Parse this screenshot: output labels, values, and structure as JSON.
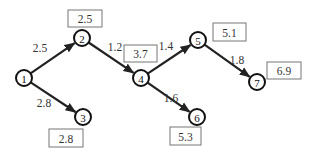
{
  "diagram": {
    "type": "directed-network",
    "nodes": [
      {
        "id": "1",
        "label": "1",
        "value": null
      },
      {
        "id": "2",
        "label": "2",
        "value": "2.5"
      },
      {
        "id": "3",
        "label": "3",
        "value": "2.8"
      },
      {
        "id": "4",
        "label": "4",
        "value": "3.7"
      },
      {
        "id": "5",
        "label": "5",
        "value": "5.1"
      },
      {
        "id": "6",
        "label": "6",
        "value": "5.3"
      },
      {
        "id": "7",
        "label": "7",
        "value": "6.9"
      }
    ],
    "edges": [
      {
        "from": "1",
        "to": "2",
        "weight": "2.5"
      },
      {
        "from": "1",
        "to": "3",
        "weight": "2.8"
      },
      {
        "from": "2",
        "to": "4",
        "weight": "1.2"
      },
      {
        "from": "4",
        "to": "5",
        "weight": "1.4"
      },
      {
        "from": "4",
        "to": "6",
        "weight": "1.6"
      },
      {
        "from": "5",
        "to": "7",
        "weight": "1.8"
      }
    ],
    "colors": {
      "line": "#222222",
      "box_border": "#777777",
      "text": "#333333"
    }
  }
}
